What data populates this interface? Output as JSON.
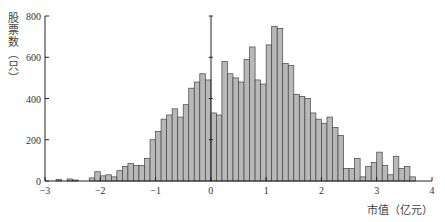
{
  "chart_data": {
    "type": "bar",
    "subtype": "histogram",
    "title": "",
    "xlabel": "市值（亿元）",
    "ylabel": "股票数（只）",
    "xlim": [
      -3,
      4
    ],
    "ylim": [
      0,
      800
    ],
    "x_ticks": [
      -3,
      -2,
      -1,
      0,
      1,
      2,
      3,
      4
    ],
    "x_tick_labels": [
      "−3",
      "−2",
      "−1",
      "0",
      "1",
      "2",
      "3",
      "4"
    ],
    "y_ticks": [
      0,
      200,
      400,
      600,
      800
    ],
    "y_tick_labels": [
      "0",
      "200",
      "400",
      "600",
      "800"
    ],
    "bin_width": 0.1,
    "grid": false,
    "legend": null,
    "bar_fill": "#b8b8b8",
    "bar_edge": "#444444",
    "reference_line_x": 0,
    "bins": [
      -2.8,
      -2.7,
      -2.6,
      -2.5,
      -2.4,
      -2.3,
      -2.2,
      -2.1,
      -2.0,
      -1.9,
      -1.8,
      -1.7,
      -1.6,
      -1.5,
      -1.4,
      -1.3,
      -1.2,
      -1.1,
      -1.0,
      -0.9,
      -0.8,
      -0.7,
      -0.6,
      -0.5,
      -0.4,
      -0.3,
      -0.2,
      -0.1,
      0.0,
      0.1,
      0.2,
      0.3,
      0.4,
      0.5,
      0.6,
      0.7,
      0.8,
      0.9,
      1.0,
      1.1,
      1.2,
      1.3,
      1.4,
      1.5,
      1.6,
      1.7,
      1.8,
      1.9,
      2.0,
      2.1,
      2.2,
      2.3,
      2.4,
      2.5,
      2.6,
      2.7,
      2.8,
      2.9,
      3.0,
      3.1,
      3.2,
      3.3,
      3.4,
      3.5,
      3.6
    ],
    "values": [
      8,
      0,
      10,
      5,
      0,
      0,
      15,
      45,
      25,
      30,
      20,
      50,
      70,
      85,
      75,
      75,
      110,
      200,
      240,
      300,
      320,
      350,
      310,
      370,
      450,
      480,
      520,
      490,
      330,
      320,
      580,
      520,
      500,
      480,
      590,
      650,
      490,
      470,
      660,
      750,
      740,
      570,
      560,
      420,
      410,
      400,
      330,
      300,
      280,
      310,
      260,
      220,
      60,
      60,
      110,
      20,
      70,
      90,
      140,
      75,
      30,
      120,
      60,
      70,
      20
    ],
    "values_note": "Heights estimated from pixel geometry; bins are 0.1 wide between −2.8 and 3.7."
  },
  "axes": {
    "y_label_chars": [
      "股",
      "票",
      "数",
      "︵",
      "只",
      "︶"
    ],
    "x_label": "市值（亿元）"
  }
}
